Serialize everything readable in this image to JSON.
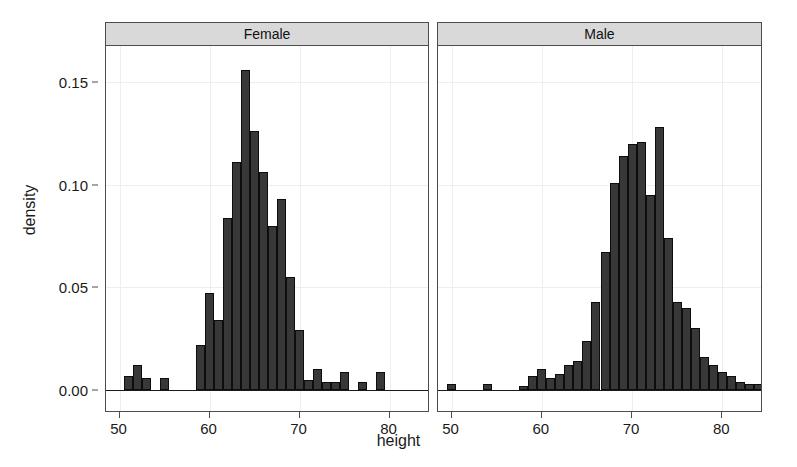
{
  "chart_data": {
    "type": "bar",
    "title": "",
    "subtitle": "",
    "xlabel": "height",
    "ylabel": "density",
    "xlim": [
      48.5,
      84.5
    ],
    "ylim": [
      0.0,
      0.163
    ],
    "grid": true,
    "legend_position": "none",
    "facet_variable": "sex",
    "bin_width": 1,
    "x_ticks": [
      50,
      60,
      70,
      80
    ],
    "x_tick_labels": [
      "50",
      "60",
      "70",
      "80"
    ],
    "y_ticks": [
      0.0,
      0.05,
      0.1,
      0.15
    ],
    "y_tick_labels": [
      "0.00",
      "0.05",
      "0.10",
      "0.15"
    ],
    "panels": [
      {
        "label": "Female",
        "x": [
          51,
          52,
          53,
          55,
          59,
          60,
          61,
          62,
          63,
          64,
          65,
          66,
          67,
          68,
          69,
          70,
          71,
          72,
          73,
          74,
          75,
          77,
          79
        ],
        "values": [
          0.007,
          0.012,
          0.006,
          0.006,
          0.022,
          0.047,
          0.034,
          0.084,
          0.111,
          0.156,
          0.126,
          0.106,
          0.08,
          0.093,
          0.055,
          0.029,
          0.005,
          0.01,
          0.004,
          0.004,
          0.009,
          0.004,
          0.009
        ]
      },
      {
        "label": "Male",
        "x": [
          50,
          54,
          58,
          59,
          60,
          61,
          62,
          63,
          64,
          65,
          66,
          67,
          68,
          69,
          70,
          71,
          72,
          73,
          74,
          75,
          76,
          77,
          78,
          79,
          80,
          81,
          82,
          83,
          84
        ],
        "values": [
          0.003,
          0.003,
          0.002,
          0.007,
          0.01,
          0.006,
          0.008,
          0.012,
          0.014,
          0.024,
          0.043,
          0.067,
          0.101,
          0.114,
          0.12,
          0.121,
          0.095,
          0.128,
          0.074,
          0.043,
          0.04,
          0.03,
          0.016,
          0.012,
          0.009,
          0.007,
          0.004,
          0.003,
          0.003
        ]
      }
    ],
    "colors": {
      "bar_fill": "#383838",
      "bar_stroke": "#0d0d0d",
      "panel_strip_fill": "#d9d9d9",
      "panel_border": "#4d4d4d",
      "grid": "#eeeeee",
      "background": "#ffffff",
      "text": "#1a1a1a"
    }
  }
}
